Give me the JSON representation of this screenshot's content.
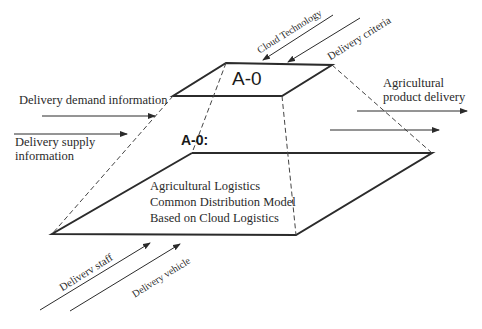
{
  "diagram": {
    "top_box": {
      "title": "A-0"
    },
    "bottom_box": {
      "title": "A-0:",
      "lines": [
        "Agricultural Logistics",
        "Common Distribution Model",
        "Based on Cloud Logistics"
      ]
    },
    "controls": [
      {
        "label": "Cloud Technology"
      },
      {
        "label": "Delivery criteria"
      }
    ],
    "inputs": [
      {
        "label": "Delivery demand information"
      },
      {
        "label_lines": [
          "Delivery supply",
          "information"
        ]
      }
    ],
    "outputs": [
      {
        "label_lines": [
          "Agricultural",
          "product delivery"
        ]
      }
    ],
    "mechanisms": [
      {
        "label": "Deliverv staff"
      },
      {
        "label": "Delivery vehicle"
      }
    ],
    "colors": {
      "line": "#2b2b2b",
      "text": "#2a2a2a",
      "background": "#ffffff"
    }
  }
}
